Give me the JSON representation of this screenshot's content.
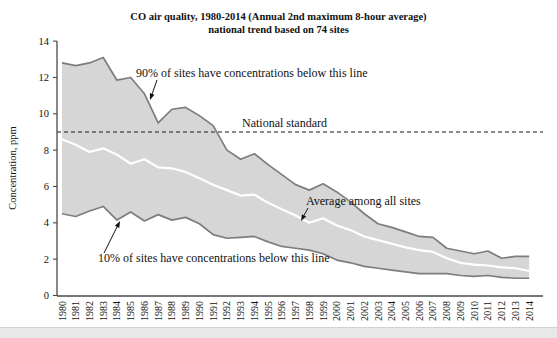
{
  "header": {
    "title_line1": "CO air quality, 1980-2014 (Annual 2nd maximum 8-hour average)",
    "title_line2": "national trend based on 74 sites"
  },
  "chart_data": {
    "type": "area",
    "title": "CO air quality, 1980-2014 (Annual 2nd maximum 8-hour average) national trend based on 74 sites",
    "xlabel": "",
    "ylabel": "Concentration, ppm",
    "ylim": [
      0,
      14
    ],
    "yticks": [
      0,
      2,
      4,
      6,
      8,
      10,
      12,
      14
    ],
    "grid": false,
    "legend_position": "none",
    "x": [
      1980,
      1981,
      1982,
      1983,
      1984,
      1985,
      1986,
      1987,
      1988,
      1989,
      1990,
      1991,
      1992,
      1993,
      1994,
      1995,
      1996,
      1997,
      1998,
      1999,
      2000,
      2001,
      2002,
      2003,
      2004,
      2005,
      2006,
      2007,
      2008,
      2009,
      2010,
      2011,
      2012,
      2013,
      2014
    ],
    "series": [
      {
        "name": "90th percentile",
        "values": [
          12.8,
          12.65,
          12.8,
          13.1,
          11.85,
          12.0,
          11.1,
          9.5,
          10.25,
          10.35,
          9.9,
          9.35,
          8.0,
          7.5,
          7.8,
          7.2,
          6.65,
          6.1,
          5.8,
          6.15,
          5.7,
          5.15,
          4.5,
          3.95,
          3.75,
          3.5,
          3.25,
          3.2,
          2.6,
          2.45,
          2.3,
          2.45,
          2.05,
          2.15,
          2.15
        ]
      },
      {
        "name": "Average among all sites",
        "values": [
          8.6,
          8.3,
          7.9,
          8.1,
          7.75,
          7.25,
          7.5,
          7.05,
          7.0,
          6.8,
          6.45,
          6.1,
          5.8,
          5.5,
          5.55,
          5.1,
          4.75,
          4.4,
          4.0,
          4.25,
          3.85,
          3.6,
          3.25,
          3.05,
          2.85,
          2.65,
          2.5,
          2.4,
          2.05,
          1.8,
          1.7,
          1.65,
          1.55,
          1.5,
          1.35
        ]
      },
      {
        "name": "10th percentile",
        "values": [
          4.5,
          4.35,
          4.65,
          4.9,
          4.15,
          4.6,
          4.1,
          4.45,
          4.15,
          4.3,
          3.95,
          3.35,
          3.15,
          3.2,
          3.25,
          2.95,
          2.7,
          2.6,
          2.5,
          2.3,
          1.95,
          1.8,
          1.6,
          1.5,
          1.4,
          1.3,
          1.2,
          1.2,
          1.2,
          1.1,
          1.05,
          1.1,
          1.0,
          0.95,
          0.95
        ]
      }
    ],
    "reference_line": {
      "label": "National standard",
      "value": 9,
      "style": "dashed"
    },
    "annotations": [
      {
        "id": "p90",
        "text": "90% of sites have concentrations below this line"
      },
      {
        "id": "standard",
        "text": "National standard"
      },
      {
        "id": "avg",
        "text": "Average among all sites"
      },
      {
        "id": "p10",
        "text": "10% of sites have concentrations below this line"
      }
    ],
    "colors": {
      "band_fill": "#d6d6d6",
      "band_edge": "#7d7d7d",
      "average_line": "#ffffff",
      "reference_line": "#1a1a1a",
      "axis": "#4a4a4a",
      "text": "#111111"
    }
  }
}
